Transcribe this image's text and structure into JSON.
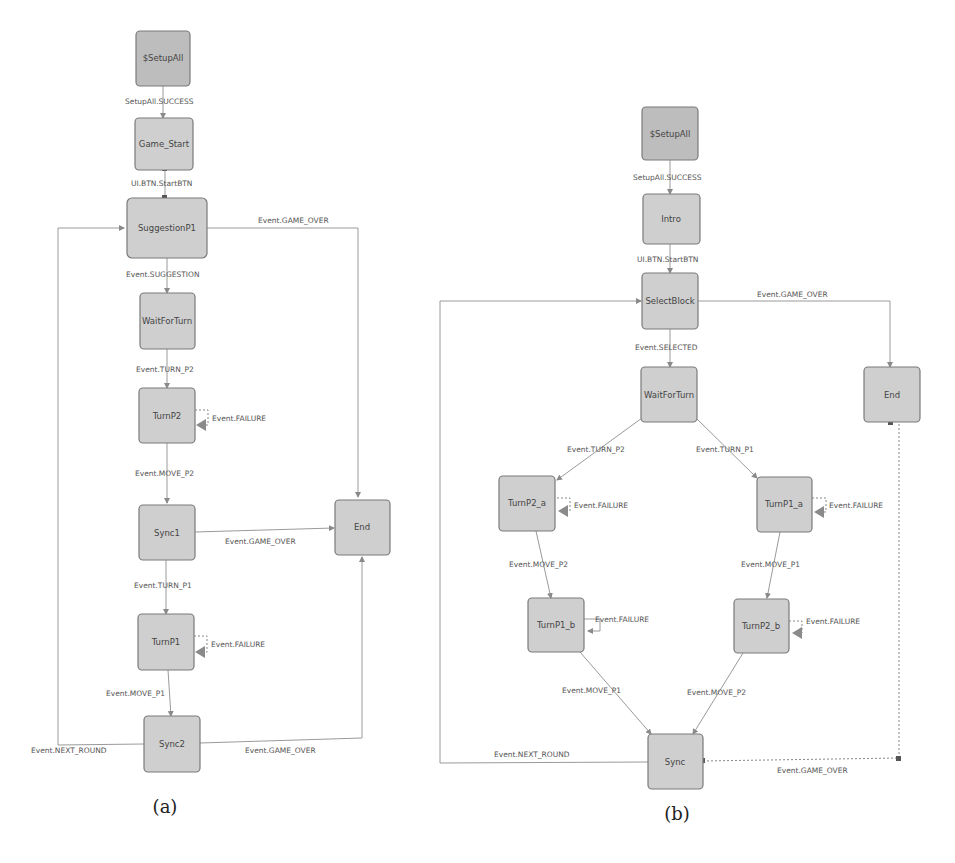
{
  "figure": {
    "panels": [
      {
        "caption": "(a)",
        "nodes": [
          {
            "id": "setupall",
            "label": "$SetupAll",
            "initial": true
          },
          {
            "id": "game_start",
            "label": "Game_Start"
          },
          {
            "id": "suggestionp1",
            "label": "SuggestionP1"
          },
          {
            "id": "waitforturn",
            "label": "WaitForTurn"
          },
          {
            "id": "turnp2",
            "label": "TurnP2"
          },
          {
            "id": "sync1",
            "label": "Sync1"
          },
          {
            "id": "turnp1",
            "label": "TurnP1"
          },
          {
            "id": "sync2",
            "label": "Sync2"
          },
          {
            "id": "end",
            "label": "End"
          }
        ],
        "edges": [
          {
            "from": "setupall",
            "to": "game_start",
            "label": "SetupAll.SUCCESS"
          },
          {
            "from": "game_start",
            "to": "suggestionp1",
            "label": "UI.BTN.StartBTN"
          },
          {
            "from": "suggestionp1",
            "to": "end",
            "label": "Event.GAME_OVER"
          },
          {
            "from": "suggestionp1",
            "to": "waitforturn",
            "label": "Event.SUGGESTION"
          },
          {
            "from": "waitforturn",
            "to": "turnp2",
            "label": "Event.TURN_P2"
          },
          {
            "from": "turnp2",
            "to": "turnp2",
            "label": "Event.FAILURE"
          },
          {
            "from": "turnp2",
            "to": "sync1",
            "label": "Event.MOVE_P2"
          },
          {
            "from": "sync1",
            "to": "end",
            "label": "Event.GAME_OVER"
          },
          {
            "from": "sync1",
            "to": "turnp1",
            "label": "Event.TURN_P1"
          },
          {
            "from": "turnp1",
            "to": "turnp1",
            "label": "Event.FAILURE"
          },
          {
            "from": "turnp1",
            "to": "sync2",
            "label": "Event.MOVE_P1"
          },
          {
            "from": "sync2",
            "to": "suggestionp1",
            "label": "Event.NEXT_ROUND"
          },
          {
            "from": "sync2",
            "to": "end",
            "label": "Event.GAME_OVER"
          }
        ]
      },
      {
        "caption": "(b)",
        "nodes": [
          {
            "id": "setupall",
            "label": "$SetupAll",
            "initial": true
          },
          {
            "id": "intro",
            "label": "Intro"
          },
          {
            "id": "selectblock",
            "label": "SelectBlock"
          },
          {
            "id": "waitforturn",
            "label": "WaitForTurn"
          },
          {
            "id": "turnp2_a",
            "label": "TurnP2_a"
          },
          {
            "id": "turnp1_a",
            "label": "TurnP1_a"
          },
          {
            "id": "turnp1_b",
            "label": "TurnP1_b"
          },
          {
            "id": "turnp2_b",
            "label": "TurnP2_b"
          },
          {
            "id": "sync",
            "label": "Sync"
          },
          {
            "id": "end",
            "label": "End"
          }
        ],
        "edges": [
          {
            "from": "setupall",
            "to": "intro",
            "label": "SetupAll.SUCCESS"
          },
          {
            "from": "intro",
            "to": "selectblock",
            "label": "UI.BTN.StartBTN"
          },
          {
            "from": "selectblock",
            "to": "end",
            "label": "Event.GAME_OVER"
          },
          {
            "from": "selectblock",
            "to": "waitforturn",
            "label": "Event.SELECTED"
          },
          {
            "from": "waitforturn",
            "to": "turnp2_a",
            "label": "Event.TURN_P2"
          },
          {
            "from": "waitforturn",
            "to": "turnp1_a",
            "label": "Event.TURN_P1"
          },
          {
            "from": "turnp2_a",
            "to": "turnp2_a",
            "label": "Event.FAILURE"
          },
          {
            "from": "turnp1_a",
            "to": "turnp1_a",
            "label": "Event.FAILURE"
          },
          {
            "from": "turnp2_a",
            "to": "turnp1_b",
            "label": "Event.MOVE_P2"
          },
          {
            "from": "turnp1_a",
            "to": "turnp2_b",
            "label": "Event.MOVE_P1"
          },
          {
            "from": "turnp1_b",
            "to": "turnp1_b",
            "label": "Event.FAILURE"
          },
          {
            "from": "turnp2_b",
            "to": "turnp2_b",
            "label": "Event.FAILURE"
          },
          {
            "from": "turnp1_b",
            "to": "sync",
            "label": "Event.MOVE_P1"
          },
          {
            "from": "turnp2_b",
            "to": "sync",
            "label": "Event.MOVE_P2"
          },
          {
            "from": "sync",
            "to": "selectblock",
            "label": "Event.NEXT_ROUND"
          },
          {
            "from": "sync",
            "to": "end",
            "label": "Event.GAME_OVER"
          }
        ]
      }
    ]
  }
}
